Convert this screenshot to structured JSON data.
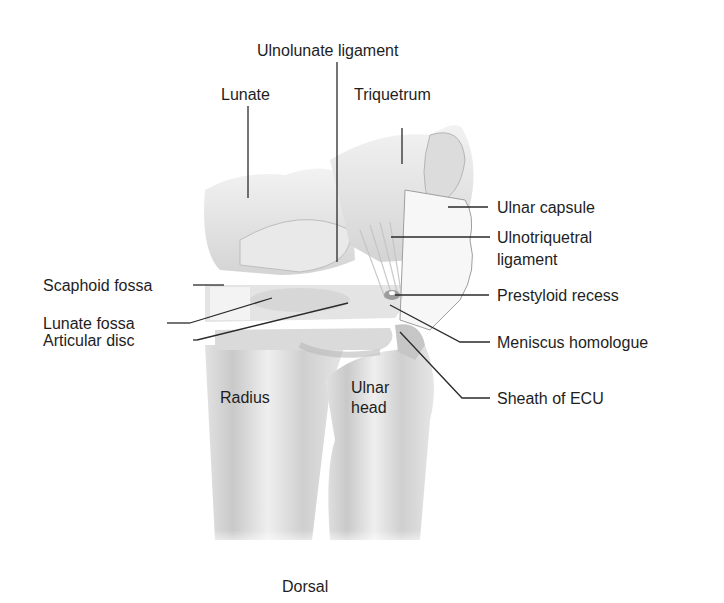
{
  "figure": {
    "view": "Dorsal",
    "labels": {
      "ulnolunate_ligament": "Ulnolunate ligament",
      "lunate": "Lunate",
      "triquetrum": "Triquetrum",
      "ulnar_capsule": "Ulnar capsule",
      "ulnotriquetral_ligament_1": "Ulnotriquetral",
      "ulnotriquetral_ligament_2": "ligament",
      "scaphoid_fossa": "Scaphoid fossa",
      "prestyloid_recess": "Prestyloid recess",
      "lunate_fossa": "Lunate fossa",
      "meniscus_homologue": "Meniscus homologue",
      "articular_disc": "Articular disc",
      "radius": "Radius",
      "ulnar_head_1": "Ulnar",
      "ulnar_head_2": "head",
      "sheath_of_ecu": "Sheath of ECU"
    }
  }
}
